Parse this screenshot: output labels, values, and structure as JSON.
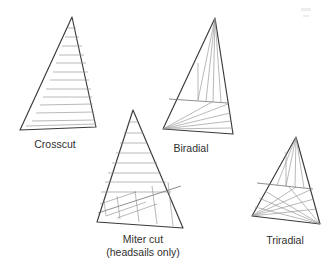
{
  "figure": {
    "type": "diagram",
    "background_color": "#ffffff",
    "outline_color": "#3a3a3a",
    "seam_color": "#8e8e8e",
    "label_color": "#2f2f2f"
  },
  "sails": [
    {
      "id": "crosscut",
      "label": "Crosscut",
      "label_x": 55,
      "label_y": 148,
      "construction": "horizontal panels perpendicular to the leech",
      "panel_seams": 13,
      "outline": "72,17 96,127 20,130",
      "seams": [
        "66,33 78,33",
        "62,45 82,45",
        "58,56 85,55",
        "55,65 87,65",
        "51,76 89,75",
        "48,85 90,85",
        "44,95 92,94",
        "41,104 93,103",
        "37,113 94,112",
        "34,121 95,120",
        "60,39 80,39",
        "30,128 96,126",
        "27,124 95,123"
      ]
    },
    {
      "id": "miter-cut",
      "label": "Miter cut",
      "label_sub": "(headsails only)",
      "label_x": 143,
      "label_y": 243,
      "label_sub_y": 256,
      "construction": "horizontal panels above a diagonal miter seam, radial panels below",
      "panel_seams": 9,
      "outline": "133,110 183,228 97,222",
      "miter_seam": "99,214 181,186",
      "outline_detail": "head 133,110 / clew 183,228 / tack 97,222",
      "seams_upper": [
        "127,124 139,124",
        "122,136 145,136",
        "118,147 150,147",
        "114,157 155,157",
        "110,167 160,167",
        "106,177 165,177",
        "103,186 170,186",
        "100,196 175,197",
        "98,205 178,207"
      ],
      "seams_lower": [
        "110,218 151,200",
        "123,220 162,196",
        "137,222 172,191",
        "150,224 178,188",
        "140,189 144,224",
        "157,190 163,226",
        "172,188 175,227",
        "123,196 127,221",
        "108,201 112,217"
      ]
    },
    {
      "id": "biradial",
      "label": "Biradial",
      "label_x": 191,
      "label_y": 152,
      "construction": "radial panels from head and tack, split by a horizontal seam",
      "head": "215,18",
      "tack": "163,129",
      "clew": "233,134",
      "outline": "215,18 233,134 163,129",
      "cross_seam": "170,99 228,103",
      "seams_head": [
        "215,18 197,101",
        "215,18 204,101",
        "215,18 211,102",
        "215,18 219,102",
        "215,18 226,103",
        "197,101 197,64"
      ],
      "seams_tack": [
        "163,129 228,104",
        "163,129 230,112",
        "163,129 231,120",
        "163,129 232,127",
        "163,129 233,134",
        "163,129 210,102"
      ]
    },
    {
      "id": "triradial",
      "label": "Triradial",
      "label_x": 285,
      "label_y": 244,
      "construction": "radial panels from head, tack and clew",
      "head": "296,137",
      "tack": "252,216",
      "clew": "320,224",
      "outline": "296,137 320,224 252,216",
      "cross_seam": "258,183 313,189",
      "seams_head": [
        "296,137 276,185",
        "296,137 285,186",
        "296,137 294,187",
        "296,137 303,188",
        "296,137 310,189",
        "285,186 285,150"
      ],
      "seams_tack": [
        "252,216 310,190",
        "252,216 313,197",
        "252,216 316,206",
        "252,216 318,214",
        "252,216 295,187"
      ],
      "seams_clew": [
        "320,224 262,192",
        "320,224 258,200",
        "320,224 256,208",
        "320,224 254,214",
        "320,224 288,187"
      ]
    }
  ]
}
